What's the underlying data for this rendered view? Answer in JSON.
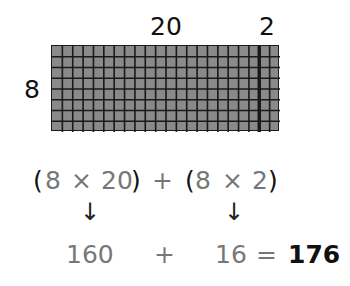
{
  "diagram": {
    "type": "area-model-multiplication",
    "grid": {
      "rows": 8,
      "columns": 22,
      "split_after_column": 20,
      "cell_color": "#8a8a8a",
      "line_color": "#1a1a1a"
    },
    "labels": {
      "width_part_1": "20",
      "width_part_2": "2",
      "height": "8"
    },
    "expression": {
      "open1": "(",
      "a1": "8",
      "op1": "×",
      "b1": "20",
      "close1": ")",
      "plus": "+",
      "open2": "(",
      "a2": "8",
      "op2": "×",
      "b2": "2",
      "close2": ")"
    },
    "arrows": [
      "↓",
      "↓"
    ],
    "result_line": {
      "partial1": "160",
      "plus": "+",
      "partial2": "16",
      "equals": "=",
      "total": "176"
    }
  }
}
